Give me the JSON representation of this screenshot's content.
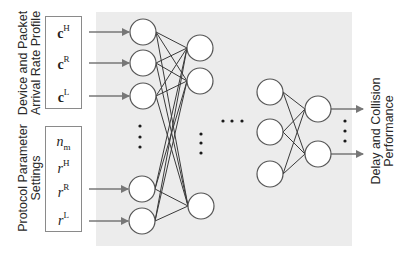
{
  "diagram": {
    "type": "neural-network",
    "colors": {
      "panel_bg": "#ececec",
      "node_stroke": "#555555",
      "node_fill": "#ffffff",
      "edge": "#3a3a3a",
      "arrow": "#777777",
      "text": "#2a2a2a"
    },
    "input_groups": [
      {
        "label_line1": "Device and Packet",
        "label_line2": "Arrival Rate Profile",
        "variables": [
          {
            "base": "c",
            "sup": "H",
            "style": "bold"
          },
          {
            "base": "c",
            "sup": "R",
            "style": "bold"
          },
          {
            "base": "c",
            "sup": "L",
            "style": "bold"
          }
        ]
      },
      {
        "label_line1": "Protocol Parameter",
        "label_line2": "Settings",
        "variables": [
          {
            "base": "n",
            "sub": "m",
            "style": "italic"
          },
          {
            "base": "r",
            "sup": "H",
            "style": "italic"
          },
          {
            "base": "r",
            "sup": "R",
            "style": "italic"
          },
          {
            "base": "r",
            "sup": "L",
            "style": "italic"
          }
        ]
      }
    ],
    "output": {
      "label_line1": "Delay and Collision",
      "label_line2": "Performance"
    },
    "ellipsis_glyph": "•"
  }
}
